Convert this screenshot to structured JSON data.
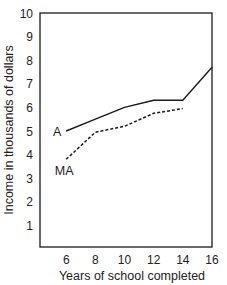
{
  "chart_data": {
    "type": "line",
    "title": "",
    "xlabel": "Years of school completed",
    "ylabel": "Income in thousands of dollars",
    "x": [
      6,
      8,
      10,
      12,
      14,
      16
    ],
    "x_ticks": [
      "6",
      "8",
      "10",
      "12",
      "14",
      "16"
    ],
    "y_ticks": [
      "1",
      "2",
      "3",
      "4",
      "5",
      "6",
      "7",
      "8",
      "9",
      "10"
    ],
    "xlim": [
      4.2,
      16
    ],
    "ylim": [
      0,
      10
    ],
    "grid": false,
    "legend": "inline labels at left end of each line",
    "series": [
      {
        "name": "A",
        "style": "solid",
        "x": [
          6,
          8,
          10,
          12,
          14,
          16
        ],
        "values": [
          5.0,
          5.5,
          6.0,
          6.3,
          6.3,
          7.7
        ]
      },
      {
        "name": "MA",
        "style": "dashed",
        "x": [
          6,
          8,
          10,
          12,
          14
        ],
        "values": [
          3.8,
          4.95,
          5.2,
          5.75,
          5.95
        ]
      }
    ]
  }
}
